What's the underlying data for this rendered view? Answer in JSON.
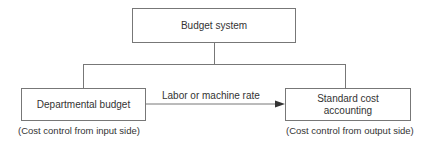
{
  "diagram": {
    "nodes": {
      "top": {
        "label": "Budget system"
      },
      "left": {
        "label": "Departmental budget",
        "caption": "(Cost control from input side)"
      },
      "right": {
        "label": "Standard cost accounting",
        "line1": "Standard cost",
        "line2": "accounting",
        "caption": "(Cost control from output side)"
      }
    },
    "edges": [
      {
        "from": "top",
        "to": "left",
        "type": "line"
      },
      {
        "from": "top",
        "to": "right",
        "type": "line"
      },
      {
        "from": "left",
        "to": "right",
        "type": "arrow",
        "label": "Labor or machine rate"
      }
    ],
    "colors": {
      "stroke": "#777777",
      "text": "#333333",
      "background": "#ffffff"
    }
  }
}
